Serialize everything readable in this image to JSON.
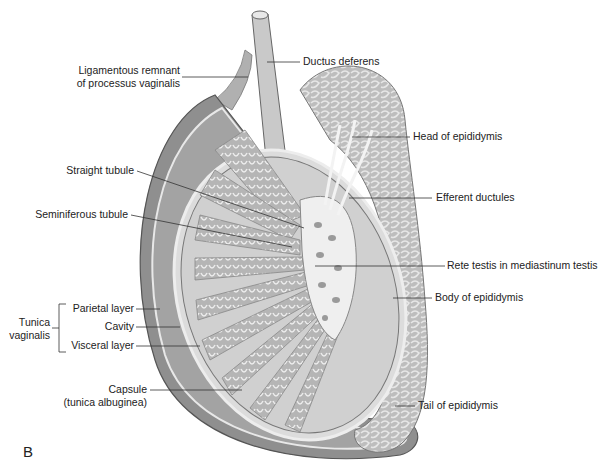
{
  "figure": {
    "panel_letter": "B"
  },
  "labels": {
    "ligamentous_remnant_line1": "Ligamentous remnant",
    "ligamentous_remnant_line2": "of processus vaginalis",
    "ductus_deferens": "Ductus deferens",
    "head_of_epididymis": "Head of epididymis",
    "straight_tubule": "Straight tubule",
    "efferent_ductules": "Efferent ductules",
    "seminiferous_tubule": "Seminiferous tubule",
    "rete_testis": "Rete testis in mediastinum testis",
    "body_of_epididymis": "Body of epididymis",
    "tunica_vaginalis_line1": "Tunica",
    "tunica_vaginalis_line2": "vaginalis",
    "parietal_layer": "Parietal layer",
    "cavity": "Cavity",
    "visceral_layer": "Visceral layer",
    "capsule_line1": "Capsule",
    "capsule_line2": "(tunica albuginea)",
    "tail_of_epididymis": "Tail of epididymis"
  },
  "colors": {
    "outer_sac": "#8a8a8a",
    "cavity": "#9d9d9d",
    "testis_body": "#d9d9d9",
    "lobule": "#a9a9a9",
    "tubule": "#f2f2f2",
    "epididymis": "#c8c8c8",
    "leader_line": "#333333"
  }
}
